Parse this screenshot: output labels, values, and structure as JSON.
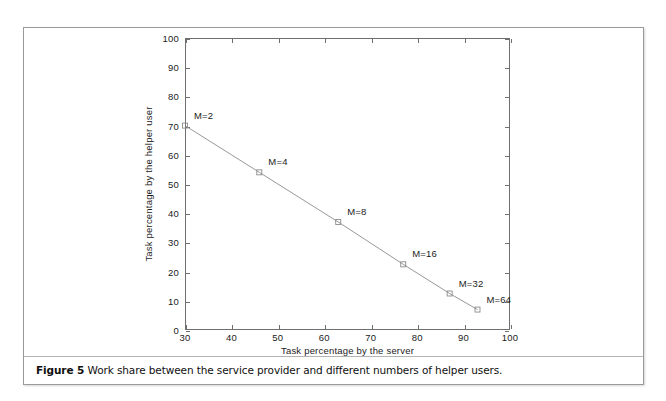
{
  "figure": {
    "caption_prefix": "Figure 5",
    "caption_body": " Work share between the service provider and different numbers of helper users."
  },
  "chart_data": {
    "type": "line",
    "title": "",
    "xlabel": "Task percentage by the server",
    "ylabel": "Task percentage by the helper user",
    "xlim": [
      30,
      100
    ],
    "ylim": [
      0,
      100
    ],
    "xticks": [
      30,
      40,
      50,
      60,
      70,
      80,
      90,
      100
    ],
    "yticks": [
      0,
      10,
      20,
      30,
      40,
      50,
      60,
      70,
      80,
      90,
      100
    ],
    "grid": false,
    "legend": "none",
    "marker": "open-square",
    "line_color": "#8c8c8c",
    "marker_color": "#8c8c8c",
    "series": [
      {
        "name": "Work share",
        "points": [
          {
            "label": "M=2",
            "x": 30,
            "y": 70.0
          },
          {
            "label": "M=4",
            "x": 46,
            "y": 54.0
          },
          {
            "label": "M=8",
            "x": 63,
            "y": 37.0
          },
          {
            "label": "M=16",
            "x": 77,
            "y": 22.5
          },
          {
            "label": "M=32",
            "x": 87,
            "y": 12.5
          },
          {
            "label": "M=64",
            "x": 93,
            "y": 7.0
          }
        ]
      }
    ],
    "annotations": [
      {
        "text": "M=2",
        "x": 30,
        "y": 70.0
      },
      {
        "text": "M=4",
        "x": 46,
        "y": 54.0
      },
      {
        "text": "M=8",
        "x": 63,
        "y": 37.0
      },
      {
        "text": "M=16",
        "x": 77,
        "y": 22.5
      },
      {
        "text": "M=32",
        "x": 87,
        "y": 12.5
      },
      {
        "text": "M=64",
        "x": 93,
        "y": 7.0
      }
    ]
  }
}
